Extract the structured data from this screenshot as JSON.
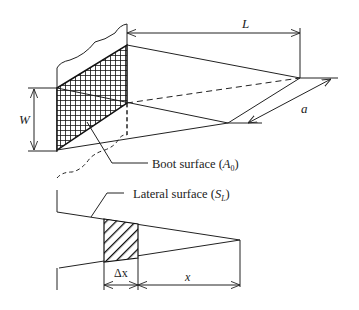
{
  "figure": {
    "top": {
      "dimension_L": "L",
      "dimension_W": "W",
      "dimension_a": "a",
      "boot_label": "Boot surface (",
      "boot_symbol": "A",
      "boot_sub": "0",
      "boot_close": ")"
    },
    "bottom": {
      "lateral_label": "Lateral surface (",
      "lateral_symbol": "S",
      "lateral_sub": "L",
      "lateral_close": ")",
      "dimension_dx": "Δx",
      "dimension_x": "x"
    },
    "colors": {
      "line": "#222222",
      "background": "#ffffff"
    }
  }
}
